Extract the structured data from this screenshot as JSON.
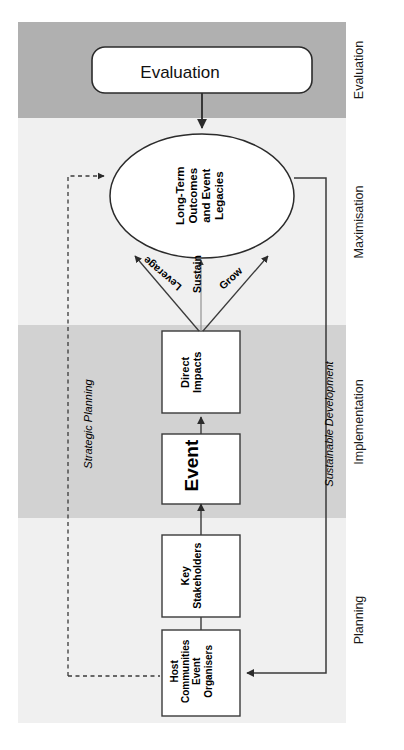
{
  "figure": {
    "phases": [
      {
        "id": "evaluation",
        "label": "Evaluation",
        "shade": "dark"
      },
      {
        "id": "maximisation",
        "label": "Maximisation",
        "shade": "light"
      },
      {
        "id": "implementation",
        "label": "Implementation",
        "shade": "mid"
      },
      {
        "id": "planning",
        "label": "Planning",
        "shade": "light"
      }
    ],
    "nodes": {
      "evaluation": {
        "label": "Evaluation",
        "shape": "rounded-rectangle"
      },
      "outcomes": {
        "label": "Long-Term\nOutcomes\nand Event\nLegacies",
        "line1": "Long-Term",
        "line2": "Outcomes",
        "line3": "and Event",
        "line4": "Legacies",
        "shape": "ellipse"
      },
      "direct_impacts": {
        "label": "Direct Impacts",
        "line1": "Direct",
        "line2": "Impacts",
        "shape": "rectangle"
      },
      "event": {
        "label": "Event",
        "shape": "rectangle"
      },
      "key_stakeholders": {
        "label": "Key Stakeholders",
        "line1": "Key",
        "line2": "Stakeholders",
        "shape": "rectangle"
      },
      "host_communities": {
        "label": "Host Communities Event Organisers",
        "line1": "Host",
        "line2": "Communities",
        "line3": "Event",
        "line4": "Organisers",
        "shape": "rectangle"
      }
    },
    "arrow_labels": {
      "leverage": "Leverage",
      "sustain": "Sustain",
      "grow": "Grow"
    },
    "side_labels": {
      "strategic_planning": "Strategic Planning",
      "sustainable_development": "Sustainable Development"
    },
    "colors": {
      "band_dark": "#b0b0b0",
      "band_light": "#f0f0f0",
      "band_mid": "#d2d2d2",
      "stroke": "#3a3a3a",
      "node_fill": "#ffffff",
      "text": "#000000"
    }
  }
}
